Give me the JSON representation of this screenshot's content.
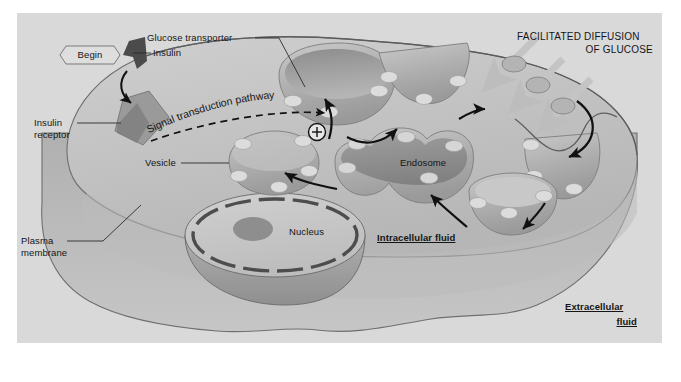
{
  "figure": {
    "kind": "biology-diagram",
    "background_color": "#d9d9d9",
    "cytoplasm_color": "#c2c2c2",
    "membrane_color": "#6f6f6f",
    "organelle_color": "#a9a9a9",
    "organelle_dark_color": "#7c7c7c",
    "transporter_color": "#d4d4d4",
    "insulin_color": "#5a5a5a",
    "receptor_color": "#8c8c8c",
    "arrow_color": "#111111",
    "glucose_arrow_color": "#bdbdbd",
    "text_color": "#151515"
  },
  "labels": {
    "begin": "Begin",
    "insulin": "Insulin",
    "insulin_receptor_line1": "Insulin",
    "insulin_receptor_line2": "receptor",
    "glucose_transporter": "Glucose transporter",
    "signal_transduction_pathway": "Signal transduction pathway",
    "plus_sign": "+",
    "vesicle": "Vesicle",
    "endosome": "Endosome",
    "nucleus": "Nucleus",
    "plasma_membrane_line1": "Plasma",
    "plasma_membrane_line2": "membrane",
    "facilitated_line1": "FACILITATED DIFFUSION",
    "facilitated_line2": "OF GLUCOSE",
    "intracellular_fluid": "Intracellular fluid",
    "extracellular_line1": "Extracellular",
    "extracellular_line2": "fluid"
  }
}
